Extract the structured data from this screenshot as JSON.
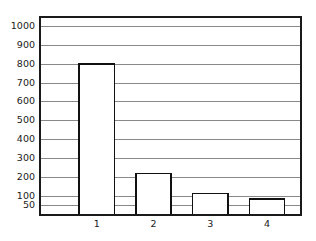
{
  "chart_data": {
    "type": "bar",
    "title": "",
    "subtitle": "",
    "xlabel": "",
    "ylabel": "",
    "categories": [
      "1",
      "2",
      "3",
      "4"
    ],
    "values": [
      800,
      220,
      115,
      85
    ],
    "series": [
      {
        "name": "",
        "values": [
          800,
          220,
          115,
          85
        ]
      }
    ],
    "ylim": [
      0,
      1050
    ],
    "xlim": [
      0,
      4.6
    ],
    "y_tick_values": [
      50,
      100,
      200,
      300,
      400,
      500,
      600,
      700,
      800,
      900,
      1000
    ],
    "y_tick_labels": [
      "50",
      "100",
      "200",
      "300",
      "400",
      "500",
      "600",
      "700",
      "800",
      "900",
      "1000"
    ],
    "x_tick_labels": [
      "1",
      "2",
      "3",
      "4"
    ],
    "grid": "horizontal",
    "grid_on": true,
    "legend": "none",
    "legend_position": "none",
    "annotations": [],
    "bar_fill_color": "#ffffff",
    "bar_edge_color": "#111111",
    "gridline_color": "#6b6b6b",
    "frame_color": "#1a1a1a",
    "background_color": "#ffffff"
  },
  "figure": {
    "width": 316,
    "height": 241,
    "plot_left": 40,
    "plot_right": 301,
    "plot_top": 17,
    "plot_bottom": 215
  }
}
